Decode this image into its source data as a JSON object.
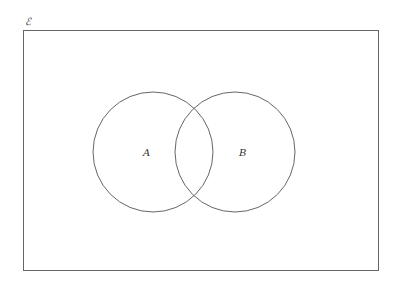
{
  "diagram": {
    "type": "venn",
    "universal_set_label": "ℰ",
    "sets": [
      {
        "label": "A",
        "cx": 153,
        "cy": 152,
        "r": 60
      },
      {
        "label": "B",
        "cx": 235,
        "cy": 152,
        "r": 60
      }
    ],
    "stroke_color": "#666666"
  }
}
